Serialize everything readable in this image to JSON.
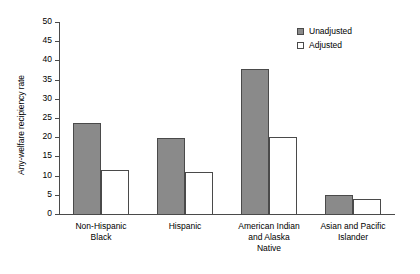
{
  "chart_data": {
    "type": "bar",
    "title": "",
    "xlabel": "",
    "ylabel": "Any-welfare recipiency rate",
    "ylim": [
      0,
      50
    ],
    "ytick_step": 5,
    "yticks": [
      50,
      45,
      40,
      35,
      30,
      25,
      20,
      15,
      10,
      5,
      0
    ],
    "grid": false,
    "legend_position": "top-right",
    "categories": [
      "Non-Hispanic\nBlack",
      "Hispanic",
      "American Indian\nand Alaska\nNative",
      "Asian and Pacific\nIslander"
    ],
    "series": [
      {
        "name": "Unadjusted",
        "color": "#8a8a8a",
        "values": [
          23.7,
          19.7,
          37.7,
          4.9
        ]
      },
      {
        "name": "Adjusted",
        "color": "#ffffff",
        "values": [
          11.5,
          11.0,
          20.1,
          4.0
        ]
      }
    ]
  },
  "legend": {
    "items": [
      {
        "label": "Unadjusted",
        "style": "filled"
      },
      {
        "label": "Adjusted",
        "style": "hollow"
      }
    ]
  },
  "colors": {
    "unadjusted_fill": "#8a8a8a",
    "adjusted_fill": "#ffffff",
    "line": "#4a4a4a",
    "background": "#ffffff"
  }
}
